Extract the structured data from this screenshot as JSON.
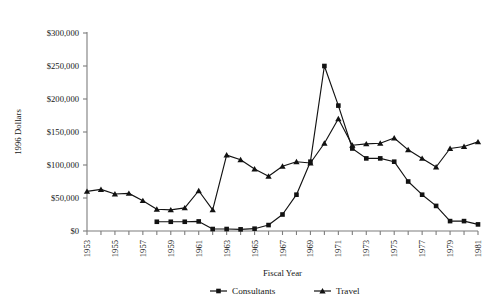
{
  "chart_data": {
    "type": "line",
    "title": "",
    "xlabel": "Fiscal Year",
    "ylabel": "1996 Dollars",
    "x": [
      1953,
      1954,
      1955,
      1956,
      1957,
      1958,
      1959,
      1960,
      1961,
      1962,
      1963,
      1964,
      1965,
      1966,
      1967,
      1968,
      1969,
      1970,
      1971,
      1972,
      1973,
      1974,
      1975,
      1976,
      1977,
      1978,
      1979,
      1980,
      1981
    ],
    "xlim": [
      1953,
      1981
    ],
    "ylim": [
      0,
      300000
    ],
    "yticks": [
      0,
      50000,
      100000,
      150000,
      200000,
      250000,
      300000
    ],
    "ytick_labels": [
      "$0",
      "$50,000",
      "$100,000",
      "$150,000",
      "$200,000",
      "$250,000",
      "$300,000"
    ],
    "xtick_labels": [
      "1953",
      "1955",
      "1957",
      "1959",
      "1961",
      "1963",
      "1965",
      "1967",
      "1969",
      "1971",
      "1973",
      "1975",
      "1977",
      "1979",
      "1981"
    ],
    "xtick_label_step": 2,
    "grid": false,
    "legend_position": "bottom",
    "series": [
      {
        "name": "Consultants",
        "marker": "square",
        "color": "#121212",
        "x": [
          1958,
          1959,
          1960,
          1961,
          1962,
          1963,
          1964,
          1965,
          1966,
          1967,
          1968,
          1969,
          1970,
          1971,
          1972,
          1973,
          1974,
          1975,
          1976,
          1977,
          1978,
          1979,
          1980,
          1981
        ],
        "values": [
          14000,
          14000,
          14000,
          14500,
          3000,
          3000,
          2500,
          3500,
          9000,
          25000,
          55000,
          105000,
          250000,
          190000,
          125000,
          110000,
          110000,
          105000,
          75000,
          55000,
          38000,
          15000,
          15000,
          10000
        ]
      },
      {
        "name": "Travel",
        "marker": "triangle",
        "color": "#121212",
        "x": [
          1953,
          1954,
          1955,
          1956,
          1957,
          1958,
          1959,
          1960,
          1961,
          1962,
          1963,
          1964,
          1965,
          1966,
          1967,
          1968,
          1969,
          1970,
          1971,
          1972,
          1973,
          1974,
          1975,
          1976,
          1977,
          1978,
          1979,
          1980,
          1981
        ],
        "values": [
          60000,
          63000,
          56000,
          57000,
          46000,
          33000,
          32000,
          35000,
          61000,
          32000,
          115000,
          108000,
          94000,
          83000,
          98000,
          105000,
          103000,
          133000,
          170000,
          130000,
          132000,
          133000,
          141000,
          123000,
          110000,
          97000,
          125000,
          128000,
          135000
        ]
      }
    ]
  },
  "legend": {
    "items": [
      {
        "label": "Consultants"
      },
      {
        "label": "Travel"
      }
    ]
  },
  "axes": {
    "x_title": "Fiscal Year",
    "y_title": "1996 Dollars"
  }
}
